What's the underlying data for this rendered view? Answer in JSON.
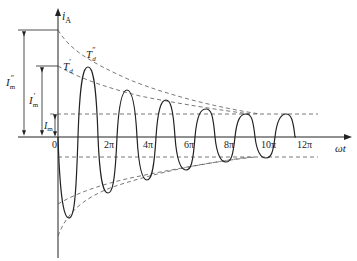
{
  "diagram": {
    "type": "damped-oscillation-current-waveform",
    "y_axis_label": "i",
    "y_axis_subscript": "A",
    "x_axis_label": "ωt",
    "origin_label": "0",
    "x_ticks": [
      "2π",
      "4π",
      "6π",
      "8π",
      "10π",
      "12π"
    ],
    "envelopes": [
      {
        "name": "subtransient",
        "label": "T",
        "sub": "d",
        "sup": "″"
      },
      {
        "name": "transient",
        "label": "T",
        "sub": "d",
        "sup": "′"
      }
    ],
    "amplitudes": [
      {
        "name": "subtransient-amplitude",
        "label": "I",
        "sub": "m",
        "sup": "″"
      },
      {
        "name": "transient-amplitude",
        "label": "I",
        "sub": "m",
        "sup": "′"
      },
      {
        "name": "steady-amplitude",
        "label": "I",
        "sub": "m",
        "sup": ""
      }
    ],
    "colors": {
      "stroke": "#222222",
      "dashed": "#555555",
      "background": "#ffffff"
    }
  }
}
